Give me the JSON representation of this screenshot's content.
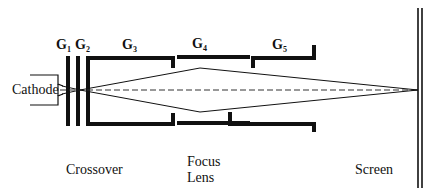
{
  "diagram": {
    "type": "electron-gun-schematic",
    "colors": {
      "ink": "#111111",
      "background": "#ffffff"
    },
    "cathode": {
      "label": "Cathode"
    },
    "electrodes": [
      {
        "id": "G1",
        "letter": "G",
        "sub": "1"
      },
      {
        "id": "G2",
        "letter": "G",
        "sub": "2"
      },
      {
        "id": "G3",
        "letter": "G",
        "sub": "3"
      },
      {
        "id": "G4",
        "letter": "G",
        "sub": "4"
      },
      {
        "id": "G5",
        "letter": "G",
        "sub": "5"
      }
    ],
    "captions": {
      "crossover": "Crossover",
      "focus_line1": "Focus",
      "focus_line2": "Lens",
      "screen": "Screen"
    }
  }
}
